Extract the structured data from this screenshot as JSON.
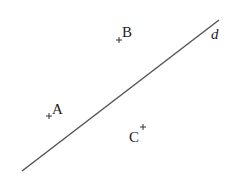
{
  "diagram": {
    "line": {
      "label": "d",
      "x1": 22,
      "y1": 171,
      "x2": 219,
      "y2": 20,
      "color": "#555555"
    },
    "points": [
      {
        "name": "A",
        "label": "A",
        "cross": [
          49,
          116
        ]
      },
      {
        "name": "B",
        "label": "B",
        "cross": [
          119,
          40
        ]
      },
      {
        "name": "C",
        "label": "C",
        "cross": [
          143,
          127
        ]
      }
    ]
  }
}
